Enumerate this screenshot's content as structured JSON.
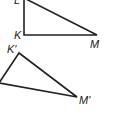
{
  "diagram": {
    "triangle_original": {
      "vertices": {
        "L": {
          "label": "L",
          "x": 24,
          "y": 0
        },
        "K": {
          "label": "K",
          "x": 24,
          "y": 35
        },
        "M": {
          "label": "M",
          "x": 97,
          "y": 35
        }
      }
    },
    "triangle_image": {
      "vertices": {
        "K_prime": {
          "label": "K'",
          "x": 19,
          "y": 53
        },
        "L_prime": {
          "label": "",
          "x": 0,
          "y": 83
        },
        "M_prime": {
          "label": "M'",
          "x": 77,
          "y": 97
        }
      }
    },
    "stroke_color": "#222222",
    "background": "#ffffff"
  }
}
